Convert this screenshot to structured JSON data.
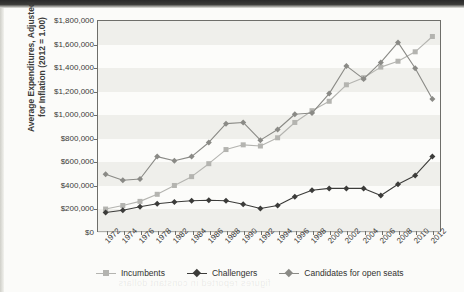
{
  "chart_data": {
    "type": "line",
    "title": "",
    "xlabel": "",
    "ylabel": "Average Expenditures, Adjusted for Inflation (2012 = 1.00)",
    "ylabel_line1": "Average Expenditures, Adjusted",
    "ylabel_line2": "for Inflation (2012 = 1.00)",
    "ylim": [
      0,
      1800000
    ],
    "ytick_step": 200000,
    "grid": false,
    "banded_background": true,
    "legend_position": "bottom",
    "ytick_labels": [
      "$1,800,000",
      "$1,600,000",
      "$1,400,000",
      "$1,200,000",
      "$1,000,000",
      "$800,000",
      "$600,000",
      "$400,000",
      "$200,000",
      "$0"
    ],
    "ytick_values": [
      1800000,
      1600000,
      1400000,
      1200000,
      1000000,
      800000,
      600000,
      400000,
      200000,
      0
    ],
    "categories": [
      "1972",
      "1974",
      "1976",
      "1978",
      "1982",
      "1984",
      "1986",
      "1988",
      "1990",
      "1992",
      "1994",
      "1996",
      "1998",
      "2000",
      "2002",
      "2004",
      "2006",
      "2008",
      "2010",
      "2012"
    ],
    "series": [
      {
        "name": "Incumbents",
        "color": "#b4b4b0",
        "marker": "square",
        "values": [
          195000,
          225000,
          260000,
          320000,
          395000,
          470000,
          580000,
          700000,
          740000,
          730000,
          800000,
          930000,
          1030000,
          1110000,
          1250000,
          1310000,
          1400000,
          1450000,
          1530000,
          1660000
        ]
      },
      {
        "name": "Challengers",
        "color": "#3c3c3a",
        "marker": "diamond",
        "values": [
          165000,
          185000,
          215000,
          240000,
          255000,
          265000,
          270000,
          265000,
          235000,
          200000,
          225000,
          300000,
          355000,
          370000,
          370000,
          370000,
          310000,
          405000,
          480000,
          640000
        ]
      },
      {
        "name": "Candidates for open seats",
        "color": "#8a8a86",
        "marker": "diamond",
        "values": [
          490000,
          440000,
          450000,
          640000,
          605000,
          640000,
          760000,
          920000,
          930000,
          780000,
          870000,
          1000000,
          1010000,
          1175000,
          1410000,
          1300000,
          1440000,
          1610000,
          1390000,
          1130000
        ]
      }
    ]
  },
  "legend": {
    "items": [
      {
        "label": "Incumbents",
        "color": "#b4b4b0",
        "marker": "square"
      },
      {
        "label": "Challengers",
        "color": "#3c3c3a",
        "marker": "diamond"
      },
      {
        "label": "Candidates for open seats",
        "color": "#8a8a86",
        "marker": "diamond"
      }
    ]
  },
  "bleed_through": [
    {
      "text": "representative expenditure comparison",
      "x": 150,
      "y": 48
    },
    {
      "text": "the incumbency advantage in campaign",
      "x": 120,
      "y": 92
    },
    {
      "text": "spending has widened over four decades",
      "x": 112,
      "y": 122
    },
    {
      "text": "across congressional election cycles",
      "x": 170,
      "y": 160
    },
    {
      "text": "source of federal election data tables",
      "x": 140,
      "y": 196
    },
    {
      "text": "figures reported in constant dollars",
      "x": 118,
      "y": 278
    }
  ]
}
